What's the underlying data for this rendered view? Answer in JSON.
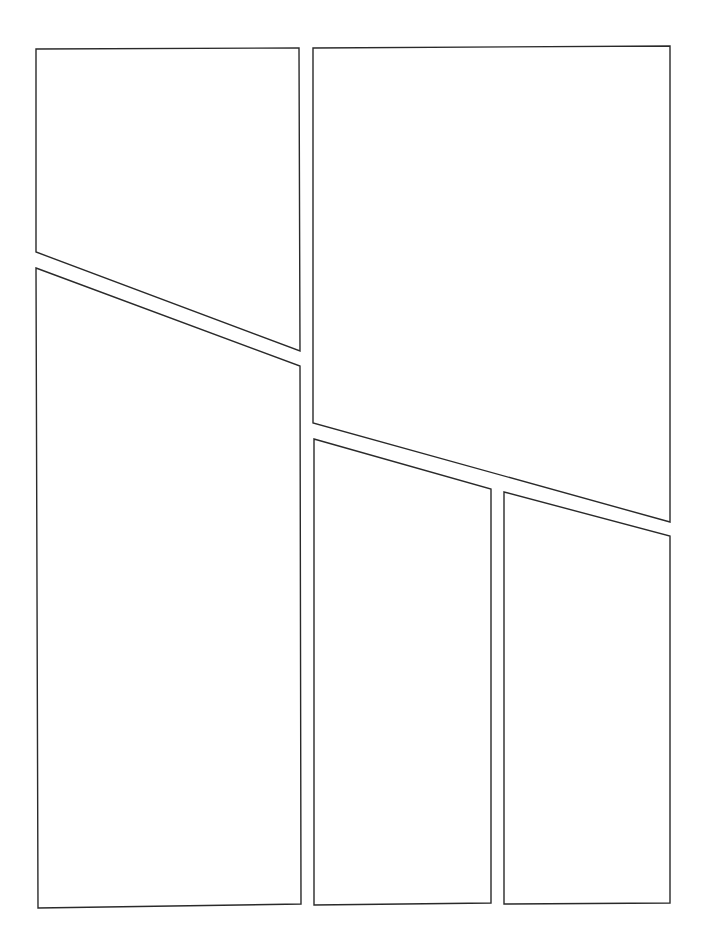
{
  "page": {
    "width": 709,
    "height": 941,
    "background": "#ffffff",
    "border_color": "#2a2a2a"
  },
  "panels": [
    {
      "id": "panel-1",
      "points": "36,49 299,48 300,351 36,252"
    },
    {
      "id": "panel-2",
      "points": "313,48 670,46 670,522 313,423"
    },
    {
      "id": "panel-3",
      "points": "36,268 300,366 301,904 38,908"
    },
    {
      "id": "panel-4",
      "points": "314,439 491,489 491,903 314,905"
    },
    {
      "id": "panel-5",
      "points": "504,492 670,536 670,903 504,904"
    }
  ]
}
